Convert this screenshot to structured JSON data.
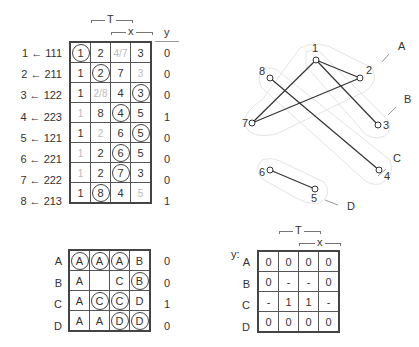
{
  "top_table": {
    "header": {
      "T": "T",
      "x": "x",
      "y": "y"
    },
    "rows": [
      {
        "label": "1 ← 111",
        "cells": [
          {
            "v": "1",
            "c": true
          },
          {
            "v": "2"
          },
          {
            "v": "4/7",
            "f": true
          },
          {
            "v": "3"
          }
        ],
        "y": "0"
      },
      {
        "label": "2 ← 211",
        "cells": [
          {
            "v": "1"
          },
          {
            "v": "2",
            "c": true
          },
          {
            "v": "7"
          },
          {
            "v": "3",
            "f": true
          }
        ],
        "y": "0"
      },
      {
        "label": "3 ← 122",
        "cells": [
          {
            "v": "1"
          },
          {
            "v": "2/8",
            "f": true
          },
          {
            "v": "4"
          },
          {
            "v": "3",
            "c": true
          }
        ],
        "y": "0"
      },
      {
        "label": "4 ← 223",
        "cells": [
          {
            "v": "1",
            "f": true
          },
          {
            "v": "8"
          },
          {
            "v": "4",
            "c": true
          },
          {
            "v": "5"
          }
        ],
        "y": "1"
      },
      {
        "label": "5 ← 121",
        "cells": [
          {
            "v": "1"
          },
          {
            "v": "2",
            "f": true
          },
          {
            "v": "6"
          },
          {
            "v": "5",
            "c": true
          }
        ],
        "y": "0"
      },
      {
        "label": "6 ← 221",
        "cells": [
          {
            "v": "1",
            "f": true
          },
          {
            "v": "2"
          },
          {
            "v": "6",
            "c": true
          },
          {
            "v": "5"
          }
        ],
        "y": "0"
      },
      {
        "label": "7 ← 222",
        "cells": [
          {
            "v": "1",
            "f": true
          },
          {
            "v": "2"
          },
          {
            "v": "7",
            "c": true
          },
          {
            "v": "3"
          }
        ],
        "y": "0"
      },
      {
        "label": "8 ← 213",
        "cells": [
          {
            "v": "1"
          },
          {
            "v": "8",
            "c": true
          },
          {
            "v": "4"
          },
          {
            "v": "5",
            "f": true
          }
        ],
        "y": "1"
      }
    ]
  },
  "graph": {
    "nodes": [
      {
        "id": "1",
        "x": 316,
        "y": 60,
        "lx": 312,
        "ly": 52
      },
      {
        "id": "2",
        "x": 360,
        "y": 78,
        "lx": 366,
        "ly": 74
      },
      {
        "id": "3",
        "x": 378,
        "y": 125,
        "lx": 383,
        "ly": 129
      },
      {
        "id": "4",
        "x": 379,
        "y": 170,
        "lx": 384,
        "ly": 180
      },
      {
        "id": "5",
        "x": 315,
        "y": 189,
        "lx": 311,
        "ly": 202
      },
      {
        "id": "6",
        "x": 270,
        "y": 170,
        "lx": 259,
        "ly": 176
      },
      {
        "id": "7",
        "x": 252,
        "y": 123,
        "lx": 242,
        "ly": 127
      },
      {
        "id": "8",
        "x": 270,
        "y": 78,
        "lx": 259,
        "ly": 75
      }
    ],
    "edges": [
      [
        "1",
        "2"
      ],
      [
        "1",
        "7"
      ],
      [
        "1",
        "3"
      ],
      [
        "2",
        "7"
      ],
      [
        "8",
        "4"
      ],
      [
        "6",
        "5"
      ]
    ],
    "groups": [
      {
        "label": "A",
        "x": 398,
        "y": 50,
        "tx1": 382,
        "ty1": 62,
        "tx2": 389,
        "ty2": 54
      },
      {
        "label": "B",
        "x": 404,
        "y": 103,
        "tx1": 388,
        "ty1": 115,
        "tx2": 396,
        "ty2": 107
      },
      {
        "label": "C",
        "x": 393,
        "y": 162,
        "tx1": 378,
        "ty1": 176,
        "tx2": 386,
        "ty2": 169
      },
      {
        "label": "D",
        "x": 347,
        "y": 210,
        "tx1": 325,
        "ty1": 200,
        "tx2": 338,
        "ty2": 205
      }
    ]
  },
  "bottom_left_table": {
    "rows": [
      {
        "label": "A",
        "cells": [
          {
            "v": "A",
            "c": true
          },
          {
            "v": "A",
            "c": true
          },
          {
            "v": "A",
            "c": true
          },
          {
            "v": "B"
          }
        ],
        "y": "0"
      },
      {
        "label": "B",
        "cells": [
          {
            "v": "A"
          },
          {
            "v": ""
          },
          {
            "v": "C"
          },
          {
            "v": "B",
            "c": true
          }
        ],
        "y": "0"
      },
      {
        "label": "C",
        "cells": [
          {
            "v": "A"
          },
          {
            "v": "C",
            "c": true
          },
          {
            "v": "C",
            "c": true
          },
          {
            "v": "D"
          }
        ],
        "y": "1"
      },
      {
        "label": "D",
        "cells": [
          {
            "v": "A"
          },
          {
            "v": "A"
          },
          {
            "v": "D",
            "c": true
          },
          {
            "v": "D",
            "c": true
          }
        ],
        "y": "0"
      }
    ]
  },
  "bottom_right_table": {
    "y_label": "y:",
    "header": {
      "T": "T",
      "x": "x"
    },
    "rows": [
      {
        "label": "A",
        "cells": [
          "0",
          "0",
          "0",
          "0"
        ]
      },
      {
        "label": "B",
        "cells": [
          "0",
          "-",
          "-",
          "0"
        ]
      },
      {
        "label": "C",
        "cells": [
          "-",
          "1",
          "1",
          "-"
        ]
      },
      {
        "label": "D",
        "cells": [
          "0",
          "0",
          "0",
          "0"
        ]
      }
    ]
  }
}
